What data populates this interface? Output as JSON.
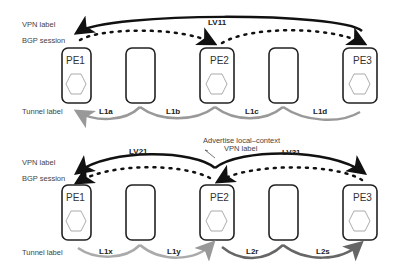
{
  "top_diagram": {
    "side_labels": {
      "vpn": "VPN label",
      "bgp": "BGP session",
      "tunnel": "Tunnel label"
    },
    "nodes": [
      "PE1",
      "",
      "PE2",
      "",
      "PE3"
    ],
    "vpn_label": "LV11",
    "tunnel_labels": [
      "L1a",
      "L1b",
      "L1c",
      "L1d"
    ]
  },
  "bottom_diagram": {
    "side_labels": {
      "vpn": "VPN label",
      "bgp": "BGP session",
      "tunnel": "Tunnel label"
    },
    "nodes": [
      "PE1",
      "",
      "PE2",
      "",
      "PE3"
    ],
    "vpn_labels": [
      "LV21",
      "LV31"
    ],
    "tunnel_labels": [
      "L1x",
      "L1y",
      "L2r",
      "L2s"
    ],
    "annotation_line1": "Advertise local–context",
    "annotation_line2": "VPN label"
  },
  "colors": {
    "dark": "#111111",
    "gray": "#999999",
    "box": "#222222"
  }
}
